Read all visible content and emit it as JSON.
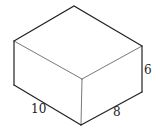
{
  "diagram": {
    "type": "rectangular-prism",
    "labels": {
      "length": "10",
      "width": "8",
      "height": "6"
    }
  }
}
